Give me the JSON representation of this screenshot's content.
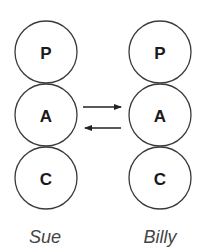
{
  "diagram": {
    "type": "transactional-analysis",
    "people": [
      {
        "name": "Sue",
        "states": [
          {
            "label": "P"
          },
          {
            "label": "A"
          },
          {
            "label": "C"
          }
        ]
      },
      {
        "name": "Billy",
        "states": [
          {
            "label": "P"
          },
          {
            "label": "A"
          },
          {
            "label": "C"
          }
        ]
      }
    ],
    "transactions": [
      {
        "from": "Sue.A",
        "to": "Billy.A",
        "direction": "right"
      },
      {
        "from": "Billy.A",
        "to": "Sue.A",
        "direction": "left"
      }
    ]
  }
}
